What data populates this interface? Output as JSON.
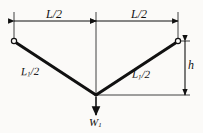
{
  "diagram": {
    "background_color": "#fbfaf8",
    "line_color": "#111111",
    "dimensions": {
      "span_left": {
        "label": "L/2",
        "symbol": "L",
        "divisor": "2"
      },
      "span_right": {
        "label": "L/2",
        "symbol": "L",
        "divisor": "2"
      },
      "height": {
        "label": "h",
        "symbol": "h"
      }
    },
    "members": {
      "left": {
        "symbol": "L",
        "subscript": "1",
        "suffix": "/2"
      },
      "right": {
        "symbol": "L",
        "subscript": "1",
        "suffix": "/2"
      }
    },
    "load": {
      "symbol": "W",
      "subscript": "1",
      "direction": "down"
    },
    "nodes": {
      "left_support": "pin-node",
      "right_support": "pin-node",
      "apex": "load-point"
    },
    "geometry": {
      "left_node_x": 14,
      "left_node_y": 41,
      "right_node_x": 178,
      "right_node_y": 41,
      "apex_x": 96,
      "apex_y": 95,
      "dimension_line_y": 21,
      "height_dim_x": 180
    }
  }
}
